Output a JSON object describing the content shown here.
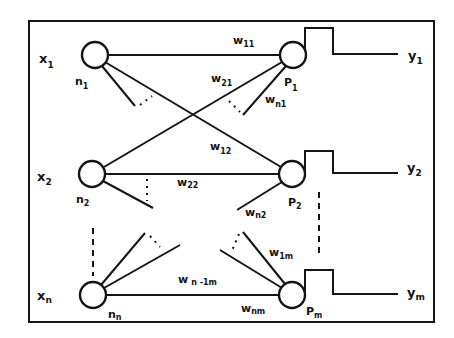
{
  "diagram": {
    "type": "neural-network-diagram",
    "colors": {
      "ink": "#141414",
      "background": "#ffffff"
    },
    "inputs": [
      {
        "id": "x1",
        "label": "x",
        "sub": "1",
        "node_label": "n",
        "node_sub": "1"
      },
      {
        "id": "x2",
        "label": "x",
        "sub": "2",
        "node_label": "n",
        "node_sub": "2"
      },
      {
        "id": "xn",
        "label": "x",
        "sub": "n",
        "node_label": "n",
        "node_sub": "n"
      }
    ],
    "outputs": [
      {
        "id": "y1",
        "label": "y",
        "sub": "1",
        "node_label": "P",
        "node_sub": "1"
      },
      {
        "id": "y2",
        "label": "y",
        "sub": "2",
        "node_label": "P",
        "node_sub": "2"
      },
      {
        "id": "ym",
        "label": "y",
        "sub": "m",
        "node_label": "P",
        "node_sub": "m"
      }
    ],
    "weights": [
      {
        "id": "w11",
        "label": "w",
        "sub": "11"
      },
      {
        "id": "w21",
        "label": "w",
        "sub": "21"
      },
      {
        "id": "wn1",
        "label": "w",
        "sub": "n1"
      },
      {
        "id": "w12",
        "label": "w",
        "sub": "12"
      },
      {
        "id": "w22",
        "label": "w",
        "sub": "22"
      },
      {
        "id": "wn2",
        "label": "w",
        "sub": "n2"
      },
      {
        "id": "w1m",
        "label": "w",
        "sub": "1m"
      },
      {
        "id": "wn1m",
        "label": "w",
        "sub": "n -1m"
      },
      {
        "id": "wnm",
        "label": "w",
        "sub": "nm"
      }
    ],
    "activation": "step-function"
  }
}
